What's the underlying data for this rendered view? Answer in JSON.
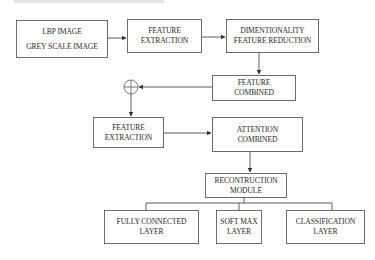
{
  "diagram": {
    "nodes": {
      "input": {
        "lines": [
          "LBP IMAGE",
          "GREY SCALE IMAGE"
        ]
      },
      "feature_extraction_1": {
        "lines": [
          "FEATURE",
          "EXTRACTION"
        ]
      },
      "dim_reduction": {
        "lines": [
          "DIMENTIONALITY",
          "FEATURE REDUCTION"
        ]
      },
      "feature_combined": {
        "lines": [
          "FEATURE",
          "COMBINED"
        ]
      },
      "sum_junction": {
        "symbol": "⊕"
      },
      "feature_extraction_2": {
        "lines": [
          "FEATURE",
          "EXTRACTION"
        ]
      },
      "attention_combined": {
        "lines": [
          "ATTENTION",
          "COMBINED"
        ]
      },
      "reconstruction": {
        "lines": [
          "RECONTRUCTION",
          "MODULE"
        ]
      },
      "fully_connected": {
        "lines": [
          "FULLY CONNECTED",
          "LAYER"
        ]
      },
      "softmax": {
        "lines": [
          "SOFT MAX",
          "LAYER"
        ]
      },
      "classification": {
        "lines": [
          "CLASSIFICATION",
          "LAYER"
        ]
      }
    },
    "edges": [
      [
        "input",
        "feature_extraction_1"
      ],
      [
        "feature_extraction_1",
        "dim_reduction"
      ],
      [
        "dim_reduction",
        "feature_combined"
      ],
      [
        "feature_combined",
        "sum_junction"
      ],
      [
        "sum_junction",
        "feature_extraction_2"
      ],
      [
        "feature_extraction_2",
        "attention_combined"
      ],
      [
        "attention_combined",
        "reconstruction"
      ],
      [
        "reconstruction",
        "fully_connected"
      ],
      [
        "reconstruction",
        "softmax"
      ],
      [
        "reconstruction",
        "classification"
      ]
    ],
    "colors": {
      "line": "#4a4a4a",
      "border": "#6b6b6b",
      "text": "#2a2a2a"
    }
  }
}
